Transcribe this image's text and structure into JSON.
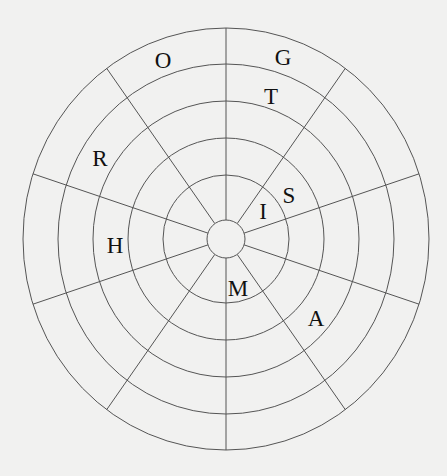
{
  "diagram": {
    "type": "polar-letter-grid",
    "center": [
      226,
      239
    ],
    "ring_radii_x": [
      63,
      98,
      133,
      168,
      203
    ],
    "ring_radii_y": [
      64,
      101,
      138,
      175,
      211
    ],
    "hub_radius": 19,
    "spoke_count": 10,
    "spoke_start_deg": 0,
    "line_color": "#555555",
    "background": "#f1f1f0",
    "letters": [
      {
        "char": "O",
        "x": 163,
        "y": 60
      },
      {
        "char": "G",
        "x": 283,
        "y": 57
      },
      {
        "char": "T",
        "x": 271,
        "y": 96
      },
      {
        "char": "R",
        "x": 100,
        "y": 158
      },
      {
        "char": "S",
        "x": 289,
        "y": 195
      },
      {
        "char": "I",
        "x": 263,
        "y": 211
      },
      {
        "char": "H",
        "x": 115,
        "y": 245
      },
      {
        "char": "M",
        "x": 238,
        "y": 288
      },
      {
        "char": "A",
        "x": 316,
        "y": 318
      }
    ]
  }
}
